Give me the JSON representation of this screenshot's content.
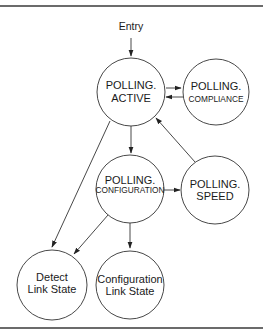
{
  "diagram": {
    "type": "state-machine",
    "entry_label": "Entry",
    "nodes": {
      "active": {
        "line1": "POLLING.",
        "line2": "ACTIVE"
      },
      "compliance": {
        "line1": "POLLING.",
        "line2": "COMPLIANCE"
      },
      "configuration": {
        "line1": "POLLING.",
        "line2": "CONFIGURATION"
      },
      "speed": {
        "line1": "POLLING.",
        "line2": "SPEED"
      },
      "detect": {
        "line1": "Detect",
        "line2": "Link State"
      },
      "config_link": {
        "line1": "Configuration",
        "line2": "Link State"
      }
    },
    "edges": [
      {
        "from": "Entry",
        "to": "POLLING.ACTIVE"
      },
      {
        "from": "POLLING.ACTIVE",
        "to": "POLLING.COMPLIANCE"
      },
      {
        "from": "POLLING.COMPLIANCE",
        "to": "POLLING.ACTIVE"
      },
      {
        "from": "POLLING.ACTIVE",
        "to": "POLLING.CONFIGURATION"
      },
      {
        "from": "POLLING.ACTIVE",
        "to": "Detect Link State"
      },
      {
        "from": "POLLING.CONFIGURATION",
        "to": "POLLING.SPEED"
      },
      {
        "from": "POLLING.SPEED",
        "to": "POLLING.ACTIVE"
      },
      {
        "from": "POLLING.CONFIGURATION",
        "to": "Detect Link State"
      },
      {
        "from": "POLLING.CONFIGURATION",
        "to": "Configuration Link State"
      }
    ],
    "colors": {
      "stroke": "#333333",
      "frame": "#6b6b6b",
      "background": "#ffffff"
    }
  }
}
